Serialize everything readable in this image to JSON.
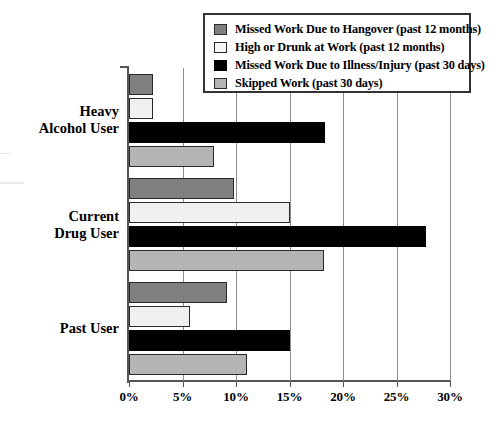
{
  "chart_data": {
    "type": "bar",
    "orientation": "horizontal",
    "title": "",
    "xlabel": "",
    "ylabel": "",
    "xlim": [
      0,
      30
    ],
    "xunit": "%",
    "xticks": [
      "0%",
      "5%",
      "10%",
      "15%",
      "20%",
      "25%",
      "30%"
    ],
    "xtick_values": [
      0,
      5,
      10,
      15,
      20,
      25,
      30
    ],
    "grid": true,
    "legend_position": "top-right",
    "categories": [
      "Heavy\nAlcohol User",
      "Current\nDrug User",
      "Past User"
    ],
    "category_labels_flat": [
      "Heavy Alcohol User",
      "Current Drug User",
      "Past User"
    ],
    "series": [
      {
        "name": "Missed Work Due to Hangover (past 12 months)",
        "color": "#7f7f7f",
        "values": [
          2.2,
          9.8,
          9.2
        ]
      },
      {
        "name": "High or Drunk at Work (past 12 months)",
        "color": "#f0f0f0",
        "values": [
          2.2,
          15.0,
          5.7
        ]
      },
      {
        "name": "Missed Work Due to Illness/Injury (past 30 days)",
        "color": "#000000",
        "values": [
          18.3,
          27.8,
          15.0
        ]
      },
      {
        "name": "Skipped Work (past 30 days)",
        "color": "#b4b4b4",
        "values": [
          7.9,
          18.2,
          11.0
        ]
      }
    ]
  },
  "legend": {
    "items": [
      {
        "label": "Missed Work Due to Hangover (past 12 months)",
        "swatch": "dark-gray-swatch"
      },
      {
        "label": "High or Drunk at Work (past 12 months)",
        "swatch": "white-swatch"
      },
      {
        "label": "Missed Work Due to Illness/Injury (past 30 days)",
        "swatch": "black-swatch"
      },
      {
        "label": "Skipped Work (past 30 days)",
        "swatch": "light-gray-swatch"
      }
    ]
  }
}
